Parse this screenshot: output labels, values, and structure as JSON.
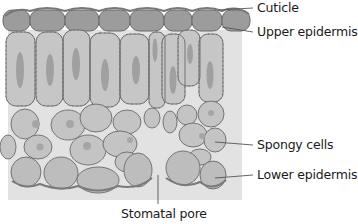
{
  "colors": {
    "cuticle": "#8a8a8a",
    "epidermis": "#9e9e9e",
    "cell_fill": "#c4c4c4",
    "cell_stroke": "#6e6e6e",
    "nucleus": "#a3a3a3",
    "air_space": "#dcdcdc",
    "leader_line": "#555555",
    "text": "#1a1a1a"
  },
  "labels": {
    "cuticle": "Cuticle",
    "upper_epidermis": "Upper epidermis",
    "spongy_cells": "Spongy cells",
    "lower_epidermis": "Lower epidermis",
    "stomatal_pore": "Stomatal pore"
  }
}
